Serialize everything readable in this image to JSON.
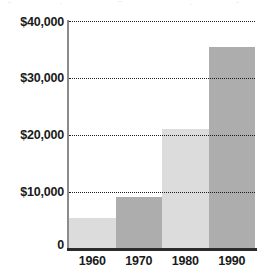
{
  "chart_data": {
    "type": "bar",
    "title": "",
    "subtitle": "",
    "xlabel": "",
    "ylabel": "",
    "categories": [
      "1960",
      "1970",
      "1980",
      "1990"
    ],
    "values": [
      5500,
      9100,
      21000,
      35500
    ],
    "series": [
      {
        "name": "",
        "values": [
          5500,
          9100,
          21000,
          35500
        ]
      }
    ],
    "ylim": [
      0,
      40000
    ],
    "xlim": [
      0,
      4
    ],
    "y_ticks": [
      0,
      10000,
      20000,
      30000,
      40000
    ],
    "y_tick_labels": [
      "0",
      "$10,000",
      "$20,000",
      "$30,000",
      "$40,000"
    ],
    "x_tick_labels": [
      "1960",
      "1970",
      "1980",
      "1990"
    ],
    "grid": true,
    "grid_axis": "y",
    "grid_style": "dotted",
    "legend": false,
    "legend_position": "none",
    "bar_colors": [
      "#dcdcdc",
      "#adadad",
      "#dcdcdc",
      "#adadad"
    ],
    "bar_gap": 0,
    "annotations": []
  },
  "colors": {
    "bar_light": "#dcdcdc",
    "bar_dark": "#adadad",
    "gridline": "#1d1d1d",
    "axis_baseline": "#2b2b2b",
    "axis_vertical": "#8c8c8c",
    "text": "#1a1a1a",
    "background": "#ffffff"
  },
  "axes": {
    "y_labels": [
      {
        "text": "$40,000",
        "value": 40000
      },
      {
        "text": "$30,000",
        "value": 30000
      },
      {
        "text": "$20,000",
        "value": 20000
      },
      {
        "text": "$10,000",
        "value": 10000
      },
      {
        "text": "0",
        "value": 0
      }
    ],
    "x_labels": [
      {
        "text": "1960"
      },
      {
        "text": "1970"
      },
      {
        "text": "1980"
      },
      {
        "text": "1990"
      }
    ]
  }
}
